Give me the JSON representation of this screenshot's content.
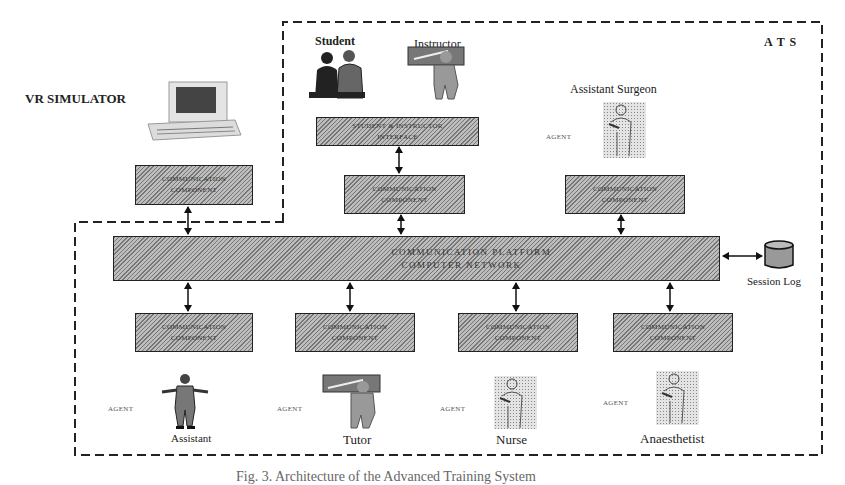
{
  "diagram": {
    "labels": {
      "vr_simulator": "VR SIMULATOR",
      "ats": "A T S",
      "student": "Student",
      "instructor": "Instructor",
      "assistant_surgeon": "Assistant Surgeon",
      "session_log": "Session Log"
    },
    "boxes": {
      "vr_comm": [
        "COMMUNICATION",
        "COMPONENT"
      ],
      "interface": [
        "STUDENT & INSTRUCTOR",
        "INTERFACE"
      ],
      "center_comm": [
        "COMMUNICATION",
        "COMPONENT"
      ],
      "right_comm": [
        "COMMUNICATION",
        "COMPONENT"
      ],
      "platform": [
        "COMMUNICATION PLATFORM",
        "COMPUTER NETWORK"
      ]
    },
    "agent_tag": "AGENT",
    "bottom_agents": [
      {
        "name": "Assistant",
        "box": [
          "COMMUNICATION",
          "COMPONENT"
        ],
        "tag": "AGENT"
      },
      {
        "name": "Tutor",
        "box": [
          "COMMUNICATION",
          "COMPONENT"
        ],
        "tag": "AGENT"
      },
      {
        "name": "Nurse",
        "box": [
          "COMMUNICATION",
          "COMPONENT"
        ],
        "tag": "AGENT"
      },
      {
        "name": "Anaesthetist",
        "box": [
          "COMMUNICATION",
          "COMPONENT"
        ],
        "tag": "AGENT"
      }
    ],
    "icons": {
      "vr_computer": "desktop-computer-icon",
      "student": "student-figures-icon",
      "instructor": "instructor-figure-icon",
      "assistant_surgeon": "surgeon-figure-icon",
      "session_log": "database-cylinder-icon",
      "assistant": "businessman-figure-icon",
      "tutor": "tutor-figure-icon",
      "nurse": "nurse-figure-icon",
      "anaesthetist": "anaesthetist-figure-icon"
    }
  },
  "caption": "Fig. 3. Architecture of the Advanced Training System"
}
